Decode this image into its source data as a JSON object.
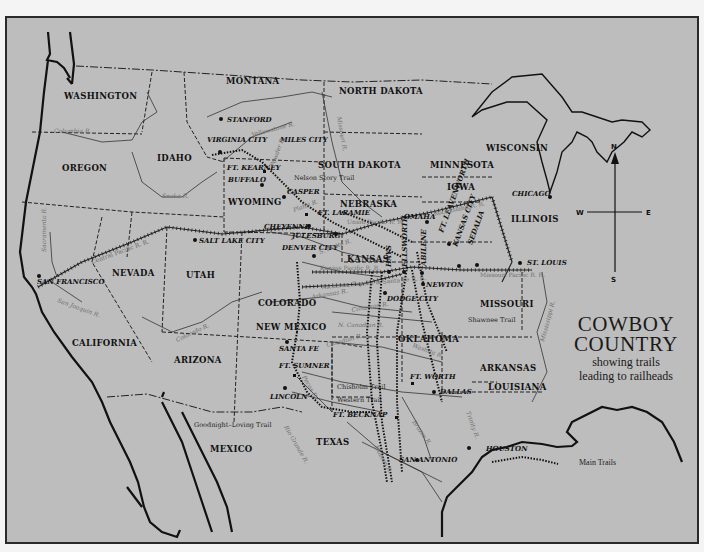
{
  "map": {
    "title": "COWBOY",
    "title_line2": "COUNTRY",
    "subtitle_line1": "showing trails",
    "subtitle_line2": "leading to railheads",
    "legend": {
      "label": "Main Trails",
      "symbol": "dotted-line"
    },
    "compass": {
      "n": "N",
      "s": "S",
      "e": "E",
      "w": "W"
    },
    "colors": {
      "background": "#bdbdbd",
      "ink": "#111111",
      "river_label": "#6e6e6e",
      "frame": "#2a2a2a"
    },
    "states": [
      "WASHINGTON",
      "OREGON",
      "IDAHO",
      "MONTANA",
      "NORTH DAKOTA",
      "SOUTH DAKOTA",
      "MINNESOTA",
      "WISCONSIN",
      "IOWA",
      "NEBRASKA",
      "WYOMING",
      "NEVADA",
      "UTAH",
      "CALIFORNIA",
      "COLORADO",
      "KANSAS",
      "MISSOURI",
      "ILLINOIS",
      "ARIZONA",
      "NEW MEXICO",
      "OKLAHOMA",
      "ARKANSAS",
      "LOUISIANA",
      "TEXAS",
      "MEXICO"
    ],
    "cities": [
      "STANFORD",
      "VIRGINIA CITY",
      "MILES CITY",
      "FT. KEARNEY",
      "BUFFALO",
      "CASPER",
      "FT. LARAMIE",
      "CHEYENNE",
      "JULESBURG",
      "DENVER CITY",
      "SALT LAKE CITY",
      "SAN FRANCISCO",
      "OMAHA",
      "CHICAGO",
      "ST. LOUIS",
      "FT. LEAVENWORTH",
      "KANSAS CITY",
      "SEDALIA",
      "HAYS",
      "ELLSWORTH",
      "ABILENE",
      "NEWTON",
      "DODGE CITY",
      "SANTA FE",
      "FT. SUMNER",
      "LINCOLN",
      "FT. BECKNAP",
      "FT. WORTH",
      "DALLAS",
      "SAN ANTONIO",
      "HOUSTON"
    ],
    "rivers": [
      "Columbia R.",
      "Snake R.",
      "Yellowstone R.",
      "Powder R.",
      "Missouri R.",
      "Red R.",
      "Platte R.",
      "S. Platte R.",
      "Sacramento R.",
      "San Joaquin R.",
      "Colorado R.",
      "Arkansas R.",
      "Cimarron R.",
      "N. Canadian R.",
      "Canadian R.",
      "Washita R.",
      "Pecos R.",
      "Rio Grande R.",
      "Brazos R.",
      "Trinity R.",
      "Nueces R.",
      "Mississippi R."
    ],
    "railroads": [
      "Central Pacific R. R.",
      "Union Pacific R. R.",
      "Kansas Pacific R. R.",
      "Atchison, Topeka & Santa Fe R. R.",
      "Rock Island R. R.",
      "Missouri Pacific R. R."
    ],
    "trails": [
      "Nelson Story Trail",
      "Goodnight–Loving Trail",
      "Chisholm Trail",
      "Western Trail",
      "Shawnee Trail"
    ]
  }
}
